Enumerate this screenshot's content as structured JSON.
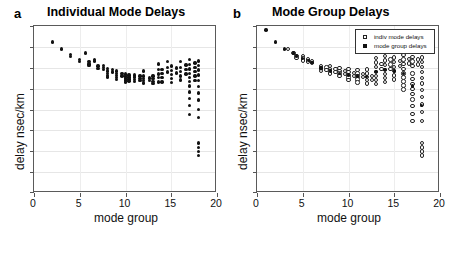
{
  "figure": {
    "panels": [
      {
        "letter": "a",
        "title": "Individual Mode Delays",
        "xlabel": "mode group",
        "ylabel": "delay nsec/km"
      },
      {
        "letter": "b",
        "title": "Mode Group Delays",
        "xlabel": "mode group",
        "ylabel": "delay nsec/km"
      }
    ],
    "legend": {
      "items": [
        {
          "marker": "open-circle-icon",
          "label": "indiv mode delays"
        },
        {
          "marker": "filled-circle-icon",
          "label": "mode group delays"
        }
      ]
    },
    "xticklabels": [
      "0",
      "5",
      "10",
      "15",
      "20"
    ]
  },
  "chart_data": [
    {
      "type": "scatter",
      "panel": "a",
      "title": "Individual Mode Delays",
      "xlabel": "mode group",
      "ylabel": "delay nsec/km",
      "xlim": [
        0,
        20
      ],
      "ylim": [
        0,
        1
      ],
      "xticks": [
        0,
        5,
        10,
        15,
        20
      ],
      "yticks": [
        0.0,
        0.125,
        0.25,
        0.375,
        0.5,
        0.625,
        0.75,
        0.875,
        1.0
      ],
      "ytick_labels": [],
      "grid": true,
      "legend": "none",
      "series": [
        {
          "name": "indiv mode delays",
          "marker": "filled-circle",
          "points": [
            [
              2.0,
              0.905
            ],
            [
              3.0,
              0.862
            ],
            [
              4.0,
              0.83
            ],
            [
              4.0,
              0.818
            ],
            [
              5.0,
              0.8
            ],
            [
              5.0,
              0.788
            ],
            [
              5.6,
              0.838
            ],
            [
              6.0,
              0.786
            ],
            [
              6.0,
              0.773
            ],
            [
              6.0,
              0.762
            ],
            [
              6.6,
              0.8
            ],
            [
              6.6,
              0.79
            ],
            [
              7.0,
              0.76
            ],
            [
              7.0,
              0.744
            ],
            [
              7.6,
              0.762
            ],
            [
              7.6,
              0.75
            ],
            [
              7.6,
              0.74
            ],
            [
              8.0,
              0.744
            ],
            [
              8.0,
              0.73
            ],
            [
              8.0,
              0.717
            ],
            [
              8.0,
              0.705
            ],
            [
              8.0,
              0.694
            ],
            [
              8.6,
              0.738
            ],
            [
              8.6,
              0.724
            ],
            [
              9.0,
              0.73
            ],
            [
              9.0,
              0.716
            ],
            [
              9.0,
              0.703
            ],
            [
              9.0,
              0.69
            ],
            [
              9.0,
              0.678
            ],
            [
              9.6,
              0.716
            ],
            [
              9.6,
              0.7
            ],
            [
              10.0,
              0.712
            ],
            [
              10.0,
              0.7
            ],
            [
              10.0,
              0.688
            ],
            [
              10.0,
              0.676
            ],
            [
              10.0,
              0.664
            ],
            [
              10.4,
              0.706
            ],
            [
              10.4,
              0.694
            ],
            [
              10.4,
              0.682
            ],
            [
              10.4,
              0.67
            ],
            [
              11.0,
              0.706
            ],
            [
              11.0,
              0.694
            ],
            [
              11.0,
              0.68
            ],
            [
              11.0,
              0.666
            ],
            [
              11.6,
              0.7
            ],
            [
              11.6,
              0.686
            ],
            [
              11.6,
              0.672
            ],
            [
              12.0,
              0.73
            ],
            [
              12.0,
              0.7
            ],
            [
              12.0,
              0.686
            ],
            [
              12.0,
              0.672
            ],
            [
              12.0,
              0.658
            ],
            [
              12.6,
              0.688
            ],
            [
              12.6,
              0.672
            ],
            [
              13.0,
              0.7
            ],
            [
              13.0,
              0.684
            ],
            [
              13.0,
              0.668
            ],
            [
              13.0,
              0.654
            ],
            [
              13.6,
              0.772
            ],
            [
              13.6,
              0.74
            ],
            [
              13.6,
              0.712
            ],
            [
              13.6,
              0.69
            ],
            [
              13.6,
              0.665
            ],
            [
              14.0,
              0.74
            ],
            [
              14.0,
              0.715
            ],
            [
              14.0,
              0.69
            ],
            [
              14.0,
              0.664
            ],
            [
              14.6,
              0.786
            ],
            [
              14.6,
              0.752
            ],
            [
              14.6,
              0.724
            ],
            [
              15.0,
              0.76
            ],
            [
              15.0,
              0.734
            ],
            [
              15.0,
              0.708
            ],
            [
              15.0,
              0.684
            ],
            [
              15.0,
              0.66
            ],
            [
              15.6,
              0.748
            ],
            [
              15.6,
              0.718
            ],
            [
              16.0,
              0.786
            ],
            [
              16.0,
              0.752
            ],
            [
              16.0,
              0.726
            ],
            [
              16.0,
              0.7
            ],
            [
              16.0,
              0.676
            ],
            [
              16.6,
              0.766
            ],
            [
              16.6,
              0.74
            ],
            [
              16.6,
              0.712
            ],
            [
              17.0,
              0.8
            ],
            [
              17.0,
              0.77
            ],
            [
              17.0,
              0.742
            ],
            [
              17.0,
              0.714
            ],
            [
              17.0,
              0.69
            ],
            [
              17.0,
              0.668
            ],
            [
              17.0,
              0.64
            ],
            [
              17.0,
              0.604
            ],
            [
              17.0,
              0.566
            ],
            [
              17.0,
              0.524
            ],
            [
              17.0,
              0.47
            ],
            [
              17.6,
              0.778
            ],
            [
              17.6,
              0.752
            ],
            [
              17.6,
              0.726
            ],
            [
              17.6,
              0.7
            ],
            [
              17.6,
              0.672
            ],
            [
              18.0,
              0.79
            ],
            [
              18.0,
              0.762
            ],
            [
              18.0,
              0.736
            ],
            [
              18.0,
              0.706
            ],
            [
              18.0,
              0.672
            ],
            [
              18.0,
              0.636
            ],
            [
              18.0,
              0.598
            ],
            [
              18.0,
              0.556
            ],
            [
              18.0,
              0.5
            ],
            [
              18.0,
              0.452
            ],
            [
              18.0,
              0.3
            ],
            [
              18.0,
              0.272
            ],
            [
              18.0,
              0.248
            ],
            [
              18.0,
              0.224
            ]
          ]
        }
      ]
    },
    {
      "type": "scatter",
      "panel": "b",
      "title": "Mode Group Delays",
      "xlabel": "mode group",
      "ylabel": "delay nsec/km",
      "xlim": [
        0,
        20
      ],
      "ylim": [
        0,
        1
      ],
      "xticks": [
        0,
        5,
        10,
        15,
        20
      ],
      "yticks": [
        0.0,
        0.125,
        0.25,
        0.375,
        0.5,
        0.625,
        0.75,
        0.875,
        1.0
      ],
      "ytick_labels": [],
      "grid": true,
      "legend": "upper-right",
      "series": [
        {
          "name": "indiv mode delays",
          "marker": "open-circle",
          "points": [
            [
              3.4,
              0.862
            ],
            [
              4.0,
              0.838
            ],
            [
              4.3,
              0.822
            ],
            [
              4.3,
              0.81
            ],
            [
              5.0,
              0.82
            ],
            [
              5.0,
              0.806
            ],
            [
              5.0,
              0.794
            ],
            [
              5.6,
              0.8
            ],
            [
              5.6,
              0.788
            ],
            [
              6.0,
              0.792
            ],
            [
              6.0,
              0.778
            ],
            [
              7.0,
              0.76
            ],
            [
              7.0,
              0.746
            ],
            [
              7.0,
              0.732
            ],
            [
              7.6,
              0.752
            ],
            [
              7.6,
              0.738
            ],
            [
              8.0,
              0.76
            ],
            [
              8.0,
              0.744
            ],
            [
              8.0,
              0.73
            ],
            [
              8.0,
              0.716
            ],
            [
              8.6,
              0.742
            ],
            [
              8.6,
              0.726
            ],
            [
              9.0,
              0.748
            ],
            [
              9.0,
              0.732
            ],
            [
              9.0,
              0.716
            ],
            [
              9.0,
              0.7
            ],
            [
              9.6,
              0.73
            ],
            [
              9.6,
              0.712
            ],
            [
              10.0,
              0.742
            ],
            [
              10.0,
              0.724
            ],
            [
              10.0,
              0.708
            ],
            [
              10.0,
              0.692
            ],
            [
              10.0,
              0.676
            ],
            [
              10.6,
              0.72
            ],
            [
              10.6,
              0.702
            ],
            [
              11.0,
              0.736
            ],
            [
              11.0,
              0.716
            ],
            [
              11.0,
              0.698
            ],
            [
              11.0,
              0.68
            ],
            [
              11.0,
              0.662
            ],
            [
              11.6,
              0.714
            ],
            [
              11.6,
              0.694
            ],
            [
              12.0,
              0.74
            ],
            [
              12.0,
              0.716
            ],
            [
              12.0,
              0.696
            ],
            [
              12.0,
              0.676
            ],
            [
              12.0,
              0.656
            ],
            [
              12.6,
              0.7
            ],
            [
              12.6,
              0.678
            ],
            [
              13.0,
              0.81
            ],
            [
              13.0,
              0.782
            ],
            [
              13.0,
              0.754
            ],
            [
              13.0,
              0.726
            ],
            [
              13.0,
              0.7
            ],
            [
              13.0,
              0.676
            ],
            [
              13.0,
              0.654
            ],
            [
              13.6,
              0.772
            ],
            [
              13.6,
              0.744
            ],
            [
              14.0,
              0.822
            ],
            [
              14.0,
              0.794
            ],
            [
              14.0,
              0.766
            ],
            [
              14.0,
              0.738
            ],
            [
              14.0,
              0.712
            ],
            [
              14.0,
              0.688
            ],
            [
              14.0,
              0.664
            ],
            [
              14.6,
              0.8
            ],
            [
              14.6,
              0.77
            ],
            [
              14.6,
              0.742
            ],
            [
              15.0,
              0.812
            ],
            [
              15.0,
              0.784
            ],
            [
              15.0,
              0.756
            ],
            [
              15.0,
              0.73
            ],
            [
              15.0,
              0.704
            ],
            [
              15.0,
              0.68
            ],
            [
              15.6,
              0.79
            ],
            [
              15.6,
              0.762
            ],
            [
              16.0,
              0.828
            ],
            [
              16.0,
              0.8
            ],
            [
              16.0,
              0.772
            ],
            [
              16.0,
              0.744
            ],
            [
              16.0,
              0.716
            ],
            [
              16.0,
              0.692
            ],
            [
              16.0,
              0.668
            ],
            [
              16.0,
              0.644
            ],
            [
              16.0,
              0.62
            ],
            [
              16.6,
              0.804
            ],
            [
              16.6,
              0.776
            ],
            [
              17.0,
              0.816
            ],
            [
              17.0,
              0.788
            ],
            [
              17.0,
              0.76
            ],
            [
              17.0,
              0.716
            ],
            [
              17.0,
              0.684
            ],
            [
              17.0,
              0.652
            ],
            [
              17.0,
              0.622
            ],
            [
              17.0,
              0.594
            ],
            [
              17.0,
              0.56
            ],
            [
              17.0,
              0.52
            ],
            [
              17.0,
              0.474
            ],
            [
              17.0,
              0.43
            ],
            [
              17.6,
              0.8
            ],
            [
              17.6,
              0.77
            ],
            [
              18.0,
              0.812
            ],
            [
              18.0,
              0.784
            ],
            [
              18.0,
              0.756
            ],
            [
              18.0,
              0.724
            ],
            [
              18.0,
              0.69
            ],
            [
              18.0,
              0.656
            ],
            [
              18.0,
              0.618
            ],
            [
              18.0,
              0.576
            ],
            [
              18.0,
              0.53
            ],
            [
              18.0,
              0.484
            ],
            [
              18.0,
              0.432
            ],
            [
              18.0,
              0.3
            ],
            [
              18.0,
              0.272
            ],
            [
              18.0,
              0.248
            ],
            [
              18.0,
              0.224
            ]
          ]
        },
        {
          "name": "mode group delays",
          "marker": "filled-circle",
          "points": [
            [
              1.0,
              0.975
            ],
            [
              2.0,
              0.905
            ],
            [
              3.0,
              0.862
            ],
            [
              4.0,
              0.838
            ],
            [
              4.3,
              0.82
            ],
            [
              5.0,
              0.806
            ],
            [
              5.6,
              0.792
            ],
            [
              6.0,
              0.78
            ],
            [
              7.0,
              0.748
            ],
            [
              8.0,
              0.73
            ],
            [
              9.0,
              0.716
            ],
            [
              10.0,
              0.706
            ],
            [
              11.0,
              0.7
            ],
            [
              12.0,
              0.696
            ],
            [
              13.0,
              0.726
            ],
            [
              14.0,
              0.74
            ],
            [
              15.0,
              0.73
            ],
            [
              16.0,
              0.716
            ],
            [
              17.0,
              0.64
            ],
            [
              18.0,
              0.524
            ]
          ]
        }
      ]
    }
  ]
}
